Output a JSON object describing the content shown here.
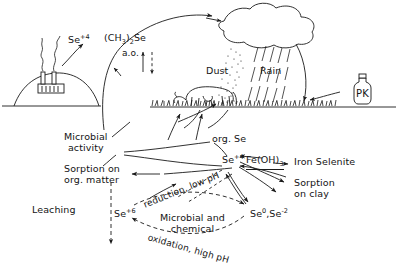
{
  "figure": {
    "kind": "selenium-biogeochemical-cycle-diagram",
    "background_color": "#ffffff",
    "ink_color": "#1a1a1a"
  },
  "atmosphere": {
    "emission_label": "Se",
    "emission_charge": "+4",
    "volatile_label_main": "(CH",
    "volatile_label_sub": "3",
    "volatile_label_tail": ")",
    "volatile_label_sub2": "2",
    "volatile_label_end": "Se",
    "volatile_also": "a.o.",
    "dust_label": "Dust",
    "rain_label": "Rain"
  },
  "surface": {
    "fertilizer_label": "PK"
  },
  "soil": {
    "microbial_line1": "Microbial",
    "microbial_line2": "activity",
    "sorption_org_line1": "Sorption on",
    "sorption_org_line2": "org. matter",
    "leaching_label": "Leaching",
    "org_se_label": "org. Se",
    "se4_label": "Se",
    "se4_charge": "+4",
    "se6_label": "Se",
    "se6_charge": "+6",
    "iron_hydroxide_main": "Fe(OH)",
    "iron_hydroxide_sub": "3",
    "iron_selenite_label": "Iron  Selenite",
    "sorption_clay_line1": "Sorption",
    "sorption_clay_line2": "on clay",
    "reduced_species_a": "Se",
    "reduced_species_a_sup": "0",
    "reduced_species_sep": ",",
    "reduced_species_b": "Se",
    "reduced_species_b_sup": "-2",
    "reduction_path_label": "reduction, low pH",
    "oxidation_path_label": "oxidation, high pH",
    "mechanism_line1": "Microbial and",
    "mechanism_line2": "chemical"
  }
}
